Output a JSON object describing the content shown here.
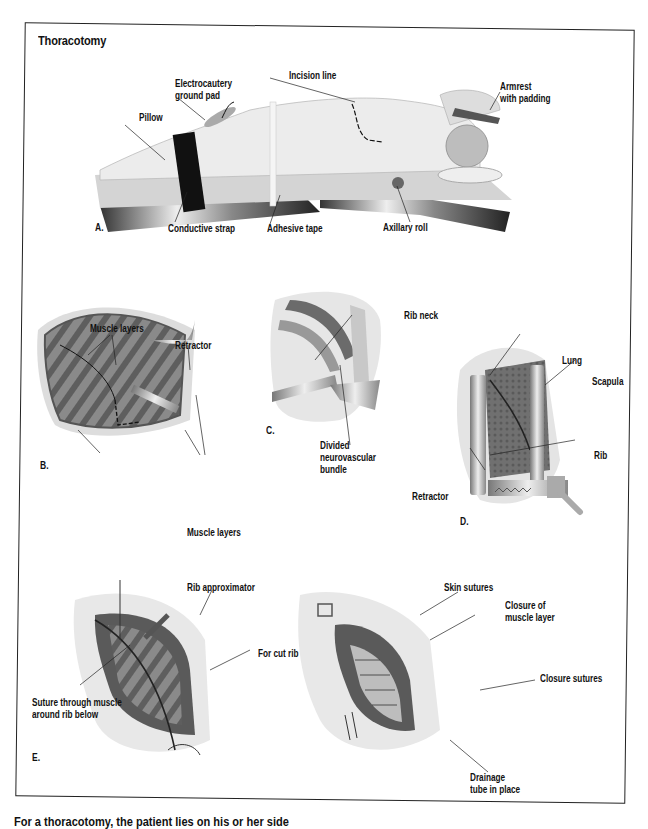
{
  "figure": {
    "title": "Thoracotomy",
    "panels": {
      "A": {
        "letter": "A.",
        "labels": {
          "electrocautery": "Electrocautery",
          "ground_pad": "ground pad",
          "incision_line": "Incision line",
          "armrest": "Armrest",
          "with_padding": "with padding",
          "pillow": "Pillow",
          "conductive_strap": "Conductive strap",
          "adhesive_tape": "Adhesive tape",
          "axillary_roll": "Axillary roll"
        }
      },
      "B": {
        "letter": "B.",
        "labels": {
          "muscle_layers_top": "Muscle layers",
          "retractor": "Retractor",
          "muscle_layers_bottom": "Muscle layers"
        }
      },
      "C": {
        "letter": "C.",
        "labels": {
          "rib_neck": "Rib neck",
          "divided": "Divided",
          "neurovascular": "neurovascular",
          "bundle": "bundle"
        }
      },
      "D": {
        "letter": "D.",
        "labels": {
          "lung": "Lung",
          "scapula": "Scapula",
          "rib": "Rib",
          "retractor": "Retractor"
        }
      },
      "E": {
        "letter": "E.",
        "labels": {
          "rib_approximator": "Rib approximator",
          "for_cut_rib": "For cut rib",
          "suture_line1": "Suture through muscle",
          "suture_line2": "around rib below"
        }
      },
      "F": {
        "labels": {
          "skin_sutures": "Skin sutures",
          "closure_of": "Closure of",
          "muscle_layer": "muscle layer",
          "closure_sutures": "Closure sutures",
          "drainage": "Drainage",
          "tube_in_place": "tube in place"
        }
      }
    },
    "caption": "For a thoracotomy, the patient lies on his or her side"
  },
  "colors": {
    "frame": "#222222",
    "text": "#111111",
    "tissue_dark": "#6b6b6b",
    "tissue_mid": "#9a9a9a",
    "tissue_light": "#d9d9d9",
    "skin": "#e8e8e8",
    "strap": "#111111"
  }
}
